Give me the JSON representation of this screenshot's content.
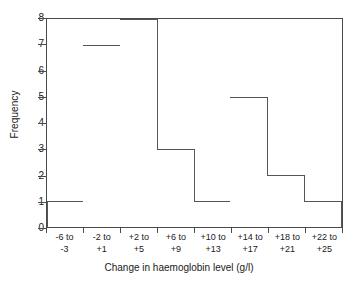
{
  "chart_data": {
    "type": "bar",
    "title": "",
    "subtitle": "",
    "xlabel": "Change in haemoglobin level (g/l)",
    "ylabel": "Frequency",
    "categories": [
      "-6 to -3",
      "-2 to +1",
      "+2 to +5",
      "+6 to +9",
      "+10 to +13",
      "+14 to +17",
      "+18 to +21",
      "+22 to +25"
    ],
    "category_lines": [
      [
        "-6 to",
        "-3"
      ],
      [
        "-2 to",
        "+1"
      ],
      [
        "+2 to",
        "+5"
      ],
      [
        "+6 to",
        "+9"
      ],
      [
        "+10 to",
        "+13"
      ],
      [
        "+14 to",
        "+17"
      ],
      [
        "+18 to",
        "+21"
      ],
      [
        "+22 to",
        "+25"
      ]
    ],
    "values": [
      1,
      7,
      8,
      3,
      1,
      5,
      2,
      1
    ],
    "ylim": [
      0,
      8
    ],
    "yticks": [
      0,
      1,
      2,
      3,
      4,
      5,
      6,
      7,
      8
    ],
    "ytick_labels": [
      "0",
      "1",
      "2",
      "3",
      "4",
      "5",
      "6",
      "7",
      "8"
    ],
    "grid": false,
    "legend": null,
    "bar_fill_color": "#ffffff",
    "bar_edge_color": "#555555",
    "axis_color": "#4a4a4a",
    "text_color": "#1a1a1a",
    "background_color": "#ffffff"
  }
}
